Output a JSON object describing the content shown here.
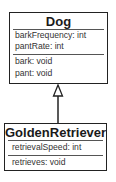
{
  "diagram": {
    "type": "UML class diagram",
    "classes": [
      {
        "name": "Dog",
        "attributes": [
          "barkFrequency: int",
          "pantRate: int"
        ],
        "methods": [
          "bark: void",
          "pant: void"
        ]
      },
      {
        "name": "GoldenRetriever",
        "attributes": [
          "retrievalSpeed: int"
        ],
        "methods": [
          "retrieves: void"
        ]
      }
    ],
    "relationships": [
      {
        "type": "inheritance",
        "from": "GoldenRetriever",
        "to": "Dog"
      }
    ]
  }
}
